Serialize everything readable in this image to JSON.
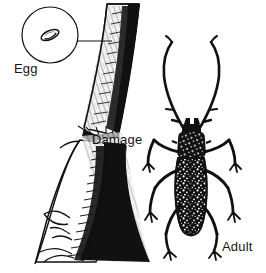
{
  "figure": {
    "background_color": "#ffffff",
    "ink_color": "#111111",
    "width": 266,
    "height": 273
  },
  "labels": {
    "egg": "Egg",
    "damage": "Damage",
    "adult": "Adult"
  },
  "parts": {
    "egg_inset": {
      "name": "egg-magnifier-circle",
      "description": "circular inset showing a single oval egg",
      "leader_line": "connects inset to bark of twig"
    },
    "twig": {
      "name": "girdled-twig",
      "description": "branch with hatched bark texture, heavy black shading on right side, chewed girdle at midpoint and stripped bark below"
    },
    "beetle": {
      "name": "adult-longhorned-beetle",
      "description": "dorsal view beetle with very long curved antennae, mottled speckled elytra, six legs",
      "antennae_count": 2,
      "legs_count": 6
    }
  }
}
